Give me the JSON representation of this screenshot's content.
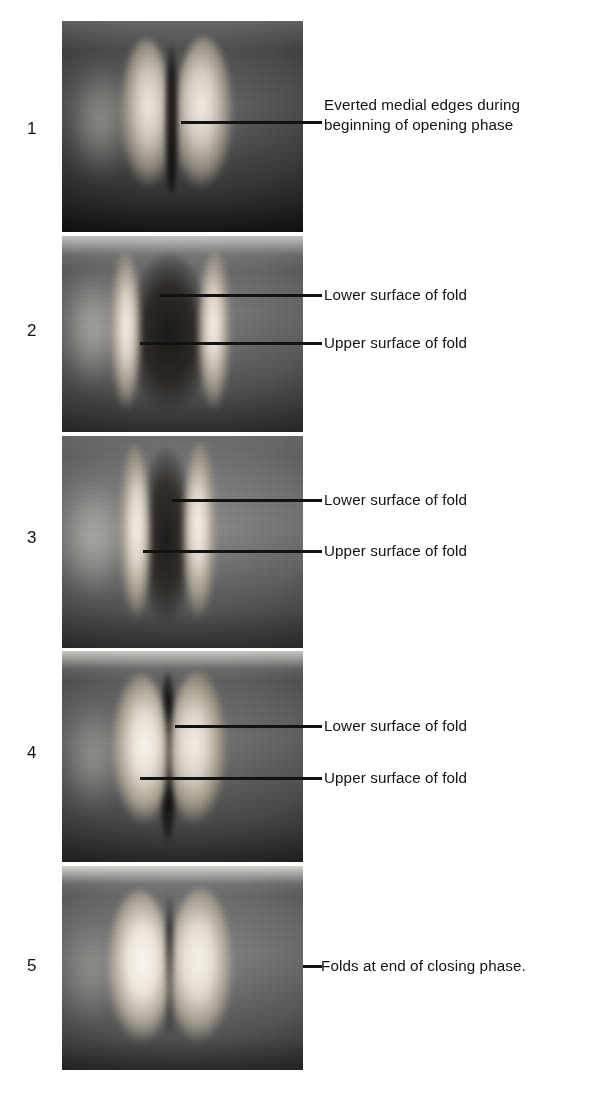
{
  "figure": {
    "background_color": "#ffffff",
    "ink_color": "#121212",
    "panel_count": 5
  },
  "panels": [
    {
      "number": "1",
      "callouts": [
        {
          "text": "Everted medial edges during\nbeginning of opening phase"
        }
      ]
    },
    {
      "number": "2",
      "callouts": [
        {
          "text": "Lower surface of fold"
        },
        {
          "text": "Upper surface of fold"
        }
      ]
    },
    {
      "number": "3",
      "callouts": [
        {
          "text": "Lower surface of fold"
        },
        {
          "text": "Upper surface of fold"
        }
      ]
    },
    {
      "number": "4",
      "callouts": [
        {
          "text": "Lower surface of fold"
        },
        {
          "text": "Upper surface of fold"
        }
      ]
    },
    {
      "number": "5",
      "callouts": [
        {
          "text": "Folds at end of closing phase."
        }
      ]
    }
  ]
}
